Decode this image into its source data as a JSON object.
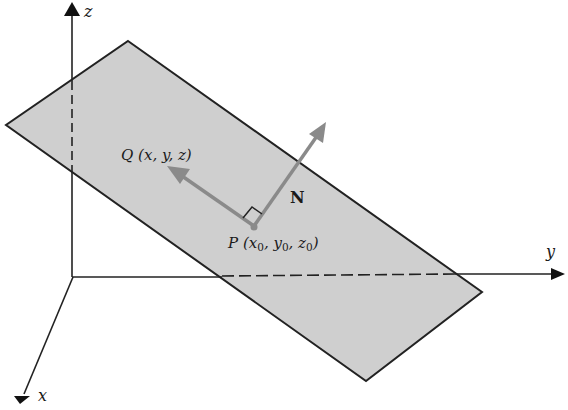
{
  "figure": {
    "colors": {
      "plane_fill": "#cfcfcf",
      "plane_edge": "#222222",
      "axis": "#222222",
      "vector": "#8a8a8a",
      "background": "#ffffff"
    },
    "axes": {
      "x": {
        "label": "x"
      },
      "y": {
        "label": "y"
      },
      "z": {
        "label": "z"
      }
    },
    "points": {
      "Q": {
        "name": "Q",
        "coords": "(x, y, z)"
      },
      "P": {
        "name": "P",
        "coords_prefix": "(x",
        "sub0": "0",
        "mid1": ", y",
        "sub1": "0",
        "mid2": ", z",
        "sub2": "0",
        "close": ")"
      }
    },
    "vectors": {
      "N": {
        "label": "N"
      }
    }
  }
}
